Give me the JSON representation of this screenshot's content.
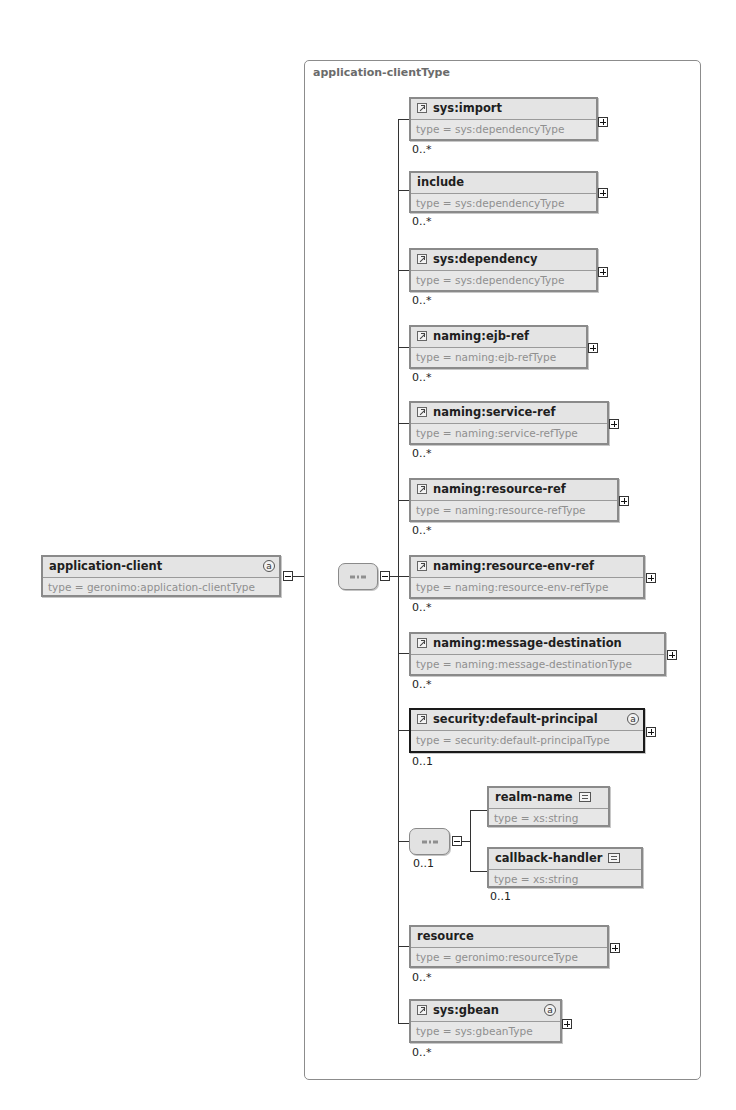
{
  "diagram": {
    "root": {
      "name": "application-client",
      "type": "type = geronimo:application-clientType",
      "has_attributes": true,
      "attr_symbol": "a"
    },
    "complex_type": {
      "title": "application-clientType"
    },
    "sequence": {
      "symbol": "sequence-compositor"
    },
    "children": [
      {
        "name": "sys:import",
        "type": "type = sys:dependencyType",
        "cardinality": "0..*",
        "is_ref": true
      },
      {
        "name": "include",
        "type": "type = sys:dependencyType",
        "cardinality": "0..*",
        "is_ref": false
      },
      {
        "name": "sys:dependency",
        "type": "type = sys:dependencyType",
        "cardinality": "0..*",
        "is_ref": true
      },
      {
        "name": "naming:ejb-ref",
        "type": "type = naming:ejb-refType",
        "cardinality": "0..*",
        "is_ref": true
      },
      {
        "name": "naming:service-ref",
        "type": "type = naming:service-refType",
        "cardinality": "0..*",
        "is_ref": true
      },
      {
        "name": "naming:resource-ref",
        "type": "type = naming:resource-refType",
        "cardinality": "0..*",
        "is_ref": true
      },
      {
        "name": "naming:resource-env-ref",
        "type": "type = naming:resource-env-refType",
        "cardinality": "0..*",
        "is_ref": true
      },
      {
        "name": "naming:message-destination",
        "type": "type = naming:message-destinationType",
        "cardinality": "0..*",
        "is_ref": true
      },
      {
        "name": "security:default-principal",
        "type": "type = security:default-principalType",
        "cardinality": "0..1",
        "is_ref": true,
        "has_attributes": true,
        "attr_symbol": "a",
        "selected": true
      },
      {
        "name": "resource",
        "type": "type = geronimo:resourceType",
        "cardinality": "0..*",
        "is_ref": false
      },
      {
        "name": "sys:gbean",
        "type": "type = sys:gbeanType",
        "cardinality": "0..*",
        "is_ref": true,
        "has_attributes": true,
        "attr_symbol": "a"
      }
    ],
    "nested_sequence": {
      "cardinality": "0..1",
      "children": [
        {
          "name": "realm-name",
          "type": "type = xs:string",
          "cardinality": "",
          "simple": true
        },
        {
          "name": "callback-handler",
          "type": "type = xs:string",
          "cardinality": "0..1",
          "simple": true
        }
      ]
    }
  }
}
